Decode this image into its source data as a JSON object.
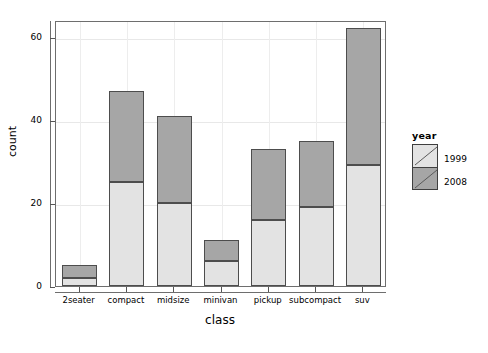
{
  "chart_data": {
    "type": "bar",
    "stacked": true,
    "title": "",
    "xlabel": "class",
    "ylabel": "count",
    "categories": [
      "2seater",
      "compact",
      "midsize",
      "minivan",
      "pickup",
      "subcompact",
      "suv"
    ],
    "series": [
      {
        "name": "1999",
        "color": "#e3e3e3",
        "values": [
          2,
          25,
          20,
          6,
          16,
          19,
          29
        ]
      },
      {
        "name": "2008",
        "color": "#a6a6a6",
        "values": [
          3,
          22,
          21,
          5,
          17,
          16,
          33
        ]
      }
    ],
    "totals": [
      5,
      47,
      41,
      11,
      33,
      35,
      62
    ],
    "ylim": [
      0,
      64
    ],
    "yticks": [
      "0",
      "20",
      "40",
      "60"
    ],
    "ytick_values": [
      0,
      20,
      40,
      60
    ],
    "grid": true,
    "legend": {
      "title": "year",
      "position": "right",
      "entries": [
        "1999",
        "2008"
      ]
    }
  },
  "axes": {
    "ylabel": "count",
    "xlabel": "class"
  },
  "legend": {
    "title": "year",
    "entries": [
      {
        "label": "1999",
        "color": "#e3e3e3"
      },
      {
        "label": "2008",
        "color": "#a6a6a6"
      }
    ]
  }
}
